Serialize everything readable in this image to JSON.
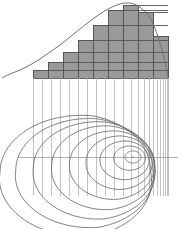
{
  "figure": {
    "background_color": "#ffffff",
    "width": 182,
    "height": 229
  },
  "chart_data": {
    "type": "area",
    "subtitle": "",
    "xlabel": "",
    "ylabel": "",
    "grid": false,
    "legend_position": "none",
    "xlim": [
      0,
      182
    ],
    "ylim": [
      0,
      229
    ],
    "panels": [
      {
        "name": "density-panel",
        "type": "area",
        "description": "Right-skewed unimodal density curve rising from a long left tail to a rounded peak near the right, then falling steeply.",
        "baseline_y": 78,
        "curve_color": "#707070",
        "curve_points": [
          [
            2,
            78
          ],
          [
            10,
            74
          ],
          [
            20,
            70
          ],
          [
            30,
            65
          ],
          [
            40,
            59
          ],
          [
            50,
            52
          ],
          [
            60,
            45
          ],
          [
            70,
            37
          ],
          [
            80,
            29
          ],
          [
            90,
            21
          ],
          [
            100,
            14
          ],
          [
            110,
            8
          ],
          [
            120,
            4
          ],
          [
            127,
            3
          ],
          [
            134,
            4
          ],
          [
            141,
            8
          ],
          [
            148,
            15
          ],
          [
            154,
            26
          ],
          [
            159,
            40
          ],
          [
            163,
            54
          ],
          [
            166,
            66
          ],
          [
            168,
            78
          ]
        ],
        "histogram": {
          "type": "bar",
          "fill_color": "#9a9a9a",
          "edge_color": "#555555",
          "baseline_y": 78,
          "bar_edges_x": [
            33,
            48,
            63,
            78,
            93,
            108,
            123,
            138,
            153,
            168
          ],
          "bar_top_y": [
            70,
            62,
            52,
            40,
            25,
            10,
            5,
            12,
            36
          ],
          "bar_heights_px": [
            8,
            16,
            26,
            38,
            53,
            68,
            73,
            66,
            42
          ],
          "categories": [
            "b1",
            "b2",
            "b3",
            "b4",
            "b5",
            "b6",
            "b7",
            "b8",
            "b9"
          ],
          "values": [
            8,
            16,
            26,
            38,
            53,
            68,
            73,
            66,
            42
          ]
        }
      },
      {
        "name": "projection-lines",
        "type": "line",
        "description": "Thin vertical drop lines projecting from the histogram baseline down into the contour panel.",
        "color": "#b4b4b4",
        "top_y": 78,
        "bottom_y": 196,
        "x_positions": [
          33,
          42,
          51,
          60,
          69,
          78,
          87,
          96,
          105,
          114,
          123,
          131,
          138,
          144,
          149,
          153,
          157,
          160,
          163,
          165,
          167,
          168
        ]
      },
      {
        "name": "contour-panel",
        "type": "line",
        "description": "Nine nested teardrop / egg-shaped contour rings, widest and rounder toward the lower-left and compressed toward the right, centered near (133,157).",
        "contour_color": "#6b6b6b",
        "center": [
          133,
          157
        ],
        "axis_line": {
          "name": "horizontal-axis",
          "color": "#9a9a9a",
          "y": 157,
          "x_start": 18,
          "x_end": 178
        },
        "rings": [
          {
            "level": 1,
            "rx": 8,
            "ry": 6,
            "cx": 133,
            "cy": 157
          },
          {
            "level": 2,
            "rx": 16,
            "ry": 12,
            "cx": 130,
            "cy": 158
          },
          {
            "level": 3,
            "rx": 25,
            "ry": 19,
            "cx": 126,
            "cy": 160
          },
          {
            "level": 4,
            "rx": 34,
            "ry": 26,
            "cx": 122,
            "cy": 162
          },
          {
            "level": 5,
            "rx": 44,
            "ry": 33,
            "cx": 117,
            "cy": 164
          },
          {
            "level": 6,
            "rx": 54,
            "ry": 40,
            "cx": 111,
            "cy": 166
          },
          {
            "level": 7,
            "rx": 64,
            "ry": 46,
            "cx": 105,
            "cy": 168
          },
          {
            "level": 8,
            "rx": 73,
            "ry": 51,
            "cx": 99,
            "cy": 170
          },
          {
            "level": 9,
            "rx": 81,
            "ry": 56,
            "cx": 94,
            "cy": 172
          }
        ],
        "extent": {
          "left": 30,
          "right": 168,
          "top": 112,
          "bottom": 214
        }
      }
    ]
  },
  "colors": {
    "background": "#ffffff",
    "histogram_fill": "#9a9a9a",
    "histogram_edge": "#555555",
    "density_curve": "#707070",
    "projection_line": "#b4b4b4",
    "contour_line": "#6b6b6b",
    "axis_line": "#9a9a9a"
  }
}
